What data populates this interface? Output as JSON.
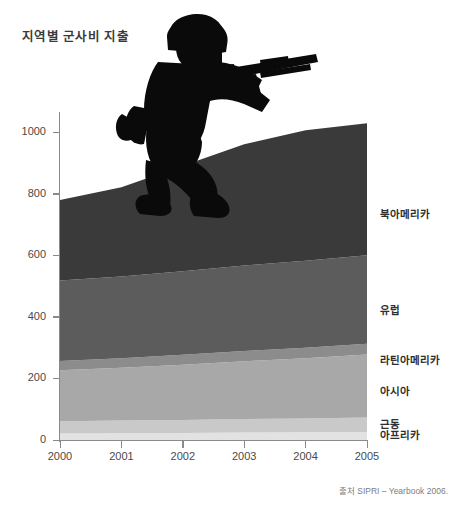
{
  "title": "지역별 군사비 지출",
  "source": "출처 SIPRI – Yearbook 2006.",
  "chart_data": {
    "type": "area",
    "stacked": true,
    "title": "지역별 군사비 지출",
    "xlabel": "",
    "ylabel": "",
    "x": [
      2000,
      2001,
      2002,
      2003,
      2004,
      2005
    ],
    "categories": [
      "2000",
      "2001",
      "2002",
      "2003",
      "2004",
      "2005"
    ],
    "xlim": [
      2000,
      2005
    ],
    "ylim": [
      0,
      1060
    ],
    "yticks": [
      0,
      200,
      400,
      600,
      800,
      1000
    ],
    "ytick_labels": [
      "0",
      "200",
      "400",
      "600",
      "800",
      "1000"
    ],
    "xtick_labels": [
      "2000",
      "2001",
      "2002",
      "2003",
      "2004",
      "2005"
    ],
    "grid": false,
    "legend_position": "right-inline",
    "series": [
      {
        "name": "아프리카",
        "color": "#e2e2e2",
        "values": [
          21,
          22,
          23,
          24,
          25,
          26
        ],
        "label_y": 22
      },
      {
        "name": "근동",
        "color": "#c9c9c9",
        "values": [
          40,
          41,
          42,
          44,
          45,
          47
        ],
        "label_y": 60
      },
      {
        "name": "아시아",
        "color": "#a8a8a8",
        "values": [
          166,
          172,
          180,
          188,
          196,
          205
        ],
        "label_y": 165
      },
      {
        "name": "라틴아메리카",
        "color": "#8c8c8c",
        "values": [
          30,
          31,
          32,
          33,
          34,
          35
        ],
        "label_y": 268
      },
      {
        "name": "유럽",
        "color": "#5c5c5c",
        "values": [
          262,
          266,
          272,
          278,
          283,
          288
        ],
        "label_y": 430
      },
      {
        "name": "북아메리카",
        "color": "#3a3a3a",
        "values": [
          261,
          290,
          343,
          395,
          424,
          429
        ],
        "label_y": 740
      }
    ],
    "totals": [
      780,
      822,
      892,
      962,
      1007,
      1030
    ],
    "annotations": [
      {
        "name": "soldier-silhouette",
        "description": "kneeling soldier aiming rifle"
      }
    ]
  },
  "colors": {
    "axis": "#8a8a8a",
    "title_text": "#3a3a3a",
    "tick_text": "#4a4a4a",
    "label_text": "#2e2e2e",
    "source_text": "#7d7d7d",
    "background": "#ffffff",
    "silhouette": "#0a0a0a"
  }
}
